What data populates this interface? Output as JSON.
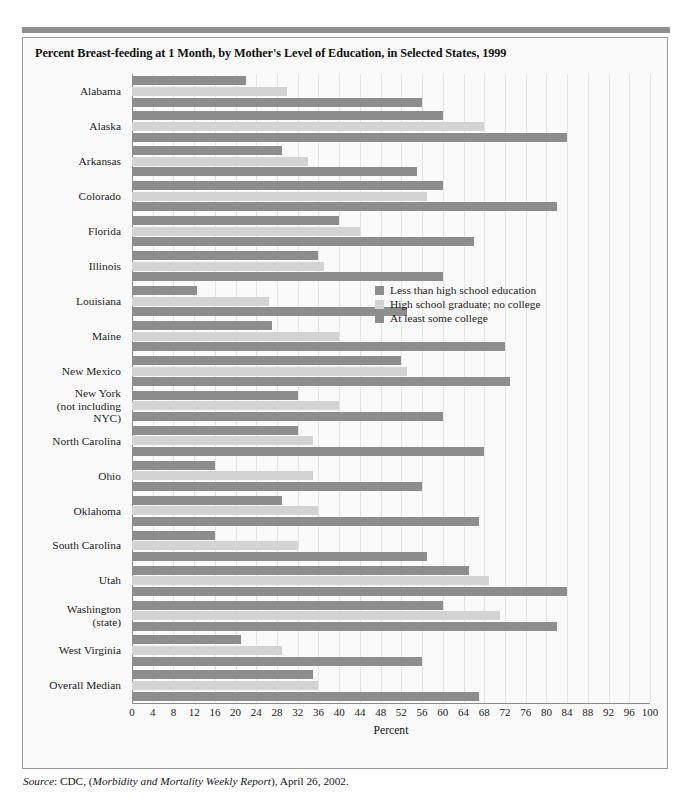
{
  "figure": {
    "title": "Percent Breast-feeding at 1 Month, by Mother's Level of Education, in Selected States, 1999",
    "source_prefix": "Source",
    "source_rest": ": CDC, (",
    "source_italic": "Morbidity and Mortality Weekly Report",
    "source_tail": "), April 26, 2002."
  },
  "colors": {
    "series_dark": "#8d8d8d",
    "series_light": "#d3d3d3",
    "panel_border": "#9a9a9a",
    "panel_background": "#fafafa",
    "gridline": "#e4e4e4",
    "top_rule": "#8f8f8f"
  },
  "chart_data": {
    "type": "bar",
    "orientation": "horizontal",
    "title": "Percent Breast-feeding at 1 Month, by Mother's Level of Education, in Selected States, 1999",
    "xlabel": "Percent",
    "ylabel": "",
    "xlim": [
      0,
      100
    ],
    "xticks": [
      0,
      4,
      8,
      12,
      16,
      20,
      24,
      28,
      32,
      36,
      40,
      44,
      48,
      52,
      56,
      60,
      64,
      68,
      72,
      76,
      80,
      84,
      88,
      92,
      96,
      100
    ],
    "grid": true,
    "legend_position": "inside-right",
    "categories": [
      "Alabama",
      "Alaska",
      "Arkansas",
      "Colorado",
      "Florida",
      "Illinois",
      "Louisiana",
      "Maine",
      "New Mexico",
      "New York\n(not including\nNYC)",
      "North Carolina",
      "Ohio",
      "Oklahoma",
      "South Carolina",
      "Utah",
      "Washington\n(state)",
      "West Virginia",
      "Overall Median"
    ],
    "series": [
      {
        "name": "Less than high school education",
        "color": "#8d8d8d",
        "values": [
          22,
          60,
          29,
          60,
          40,
          36,
          12.5,
          27,
          52,
          32,
          32,
          16,
          29,
          16,
          65,
          60,
          21,
          35
        ]
      },
      {
        "name": "High school graduate; no college",
        "color": "#d3d3d3",
        "values": [
          30,
          68,
          34,
          57,
          44,
          37,
          26.5,
          40,
          53,
          40,
          35,
          35,
          36,
          32,
          69,
          71,
          29,
          36
        ]
      },
      {
        "name": "At least some college",
        "color": "#8d8d8d",
        "values": [
          56,
          84,
          55,
          82,
          66,
          60,
          53,
          72,
          73,
          60,
          68,
          56,
          67,
          57,
          84,
          82,
          56,
          67
        ]
      }
    ]
  }
}
